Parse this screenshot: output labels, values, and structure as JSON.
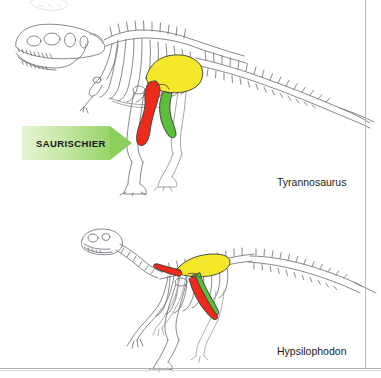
{
  "figure": {
    "background_color": "#ffffff",
    "border_color": "#b9b9b9"
  },
  "panels": [
    {
      "id": "saurischia",
      "group_label": "SAURISCHIER",
      "species_caption": "Tyrannosaurus",
      "pelvis_bones": [
        {
          "name": "ilium",
          "color": "#f5e72a",
          "note": "large yellow blade above hip socket"
        },
        {
          "name": "pubis",
          "color": "#ee2b1b",
          "note": "red, directed forward and downward"
        },
        {
          "name": "ischium",
          "color": "#5bbf3a",
          "note": "green, directed backward and downward"
        }
      ]
    },
    {
      "id": "ornithischia",
      "group_label": "ORNITHISCHIER",
      "species_caption": "Hypsilophodon",
      "pelvis_bones": [
        {
          "name": "ilium",
          "color": "#f5e72a",
          "note": "yellow blade along the backbone"
        },
        {
          "name": "pubis",
          "color": "#ee2b1b",
          "note": "red, with forward prepubic process and shaft lying back alongside the ischium"
        },
        {
          "name": "ischium",
          "color": "#5bbf3a",
          "note": "green, directed backward and downward"
        }
      ]
    }
  ],
  "arrows": {
    "saurischia_label": "SAURISCHIER",
    "ornithischia_label": "ORNITHISCHIER",
    "fill_start_color": "#e4f4d4",
    "fill_end_color": "#97d46a"
  },
  "captions": {
    "tyrannosaurus": "Tyrannosaurus",
    "hypsilophodon": "Hypsilophodon"
  },
  "colors": {
    "ilium_yellow": "#f5e72a",
    "pubis_red": "#ee2b1b",
    "ischium_green": "#5bbf3a",
    "bone_outline": "#5a5a62",
    "text": "#1b1b1b"
  }
}
